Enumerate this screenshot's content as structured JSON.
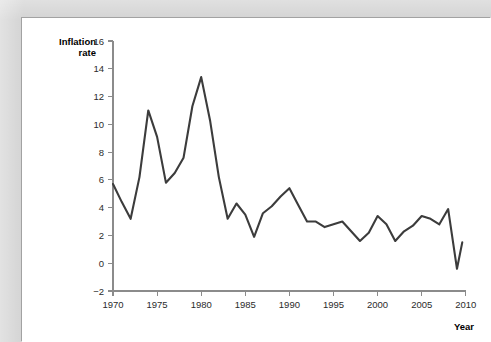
{
  "page": {
    "background_color": "#d3d3d3",
    "card_background_color": "#ffffff"
  },
  "chart_data": {
    "type": "line",
    "title": "",
    "subtitle": "",
    "xlabel": "Year",
    "ylabel": "Inflation rate",
    "ylabel_line1": "Inflation",
    "ylabel_line2": "rate",
    "xlim": [
      1969,
      2010.5
    ],
    "ylim": [
      -2,
      16
    ],
    "yticks": [
      -2,
      0,
      2,
      4,
      6,
      8,
      10,
      12,
      14,
      16
    ],
    "ytick_labels": [
      "−2",
      "0",
      "2",
      "4",
      "6",
      "8",
      "10",
      "12",
      "14",
      "16"
    ],
    "xticks": [
      1970,
      1975,
      1980,
      1985,
      1990,
      1995,
      2000,
      2005,
      2010
    ],
    "xtick_labels": [
      "1970",
      "1975",
      "1980",
      "1985",
      "1990",
      "1995",
      "2000",
      "2005",
      "2010"
    ],
    "grid": false,
    "legend": false,
    "legend_position": "none",
    "line_color": "#3c3c3c",
    "axis_color": "#8b8b8b",
    "x": [
      1970,
      1971,
      1972,
      1973,
      1974,
      1975,
      1976,
      1977,
      1978,
      1979,
      1980,
      1981,
      1982,
      1983,
      1984,
      1985,
      1986,
      1987,
      1988,
      1989,
      1990,
      1991,
      1992,
      1993,
      1994,
      1995,
      1996,
      1997,
      1998,
      1999,
      2000,
      2001,
      2002,
      2003,
      2004,
      2005,
      2006,
      2007,
      2008,
      2009
    ],
    "values": [
      5.7,
      4.4,
      3.2,
      6.2,
      11.0,
      9.1,
      5.8,
      6.5,
      7.6,
      11.3,
      13.4,
      10.3,
      6.2,
      3.2,
      4.3,
      3.5,
      1.9,
      3.6,
      4.1,
      4.8,
      5.4,
      4.2,
      3.0,
      3.0,
      2.6,
      2.8,
      3.0,
      2.3,
      1.6,
      2.2,
      3.4,
      2.8,
      1.6,
      2.3,
      2.7,
      3.4,
      3.2,
      2.8,
      3.9,
      -0.4
    ],
    "last_point": {
      "year": 2009,
      "value": 1.5
    },
    "peaks": [
      {
        "year": 1974,
        "value": 11.0
      },
      {
        "year": 1980,
        "value": 13.4
      }
    ],
    "troughs": [
      {
        "year": 1986,
        "value": 1.9
      },
      {
        "year": 2009,
        "value": -0.4
      }
    ]
  }
}
